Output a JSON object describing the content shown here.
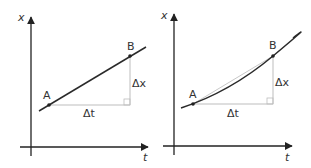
{
  "panels": [
    {
      "name": "linear",
      "axis_x_label": "x",
      "axis_t_label": "t",
      "point_a_label": "A",
      "point_b_label": "B",
      "delta_t_label": "Δt",
      "delta_x_label": "Δx"
    },
    {
      "name": "curved",
      "axis_x_label": "x",
      "axis_t_label": "t",
      "point_a_label": "A",
      "point_b_label": "B",
      "delta_t_label": "Δt",
      "delta_x_label": "Δx"
    }
  ],
  "colors": {
    "axis": "#222222",
    "curve": "#2a2a2a",
    "guide": "#bdbdbd",
    "text": "#333333"
  }
}
